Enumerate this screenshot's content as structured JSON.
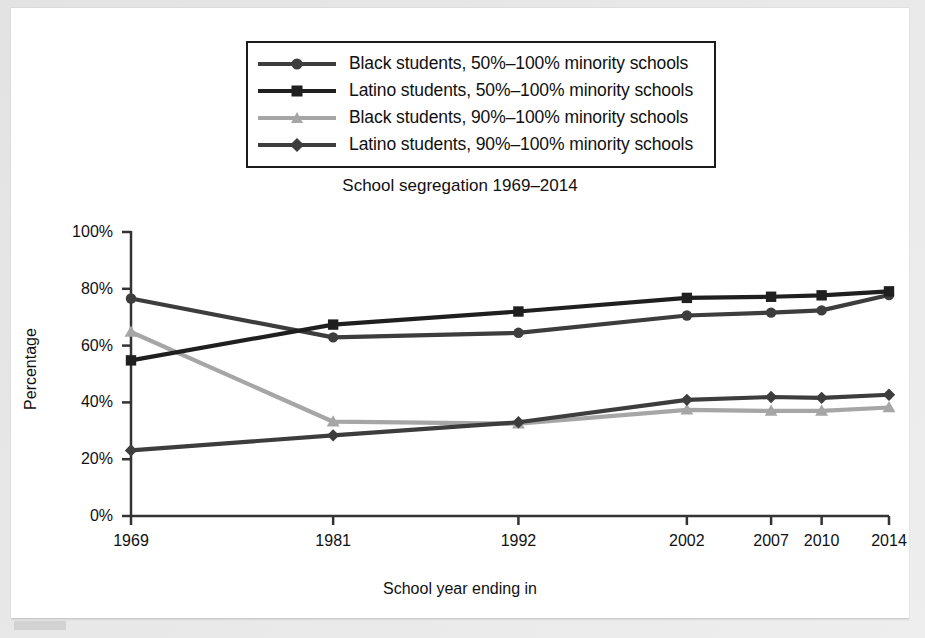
{
  "chart_data": {
    "type": "line",
    "title": "School segregation 1969–2014",
    "xlabel": "School year ending in",
    "ylabel": "Percentage",
    "x": [
      1969,
      1981,
      1992,
      2002,
      2007,
      2010,
      2014
    ],
    "categories": [
      "1969",
      "1981",
      "1992",
      "2002",
      "2007",
      "2010",
      "2014"
    ],
    "ylim": [
      0,
      100
    ],
    "yticks": [
      0,
      20,
      40,
      60,
      80,
      100
    ],
    "ytick_labels": [
      "0%",
      "20%",
      "40%",
      "60%",
      "80%",
      "100%"
    ],
    "grid": false,
    "legend_position": "top-center-outside",
    "series": [
      {
        "name": "Black students, 50%–100% minority schools",
        "marker": "circle",
        "color": "#3d3d3d",
        "values": [
          76.6,
          62.9,
          64.5,
          70.6,
          71.6,
          72.4,
          77.8
        ]
      },
      {
        "name": "Latino students, 50%–100% minority schools",
        "marker": "square",
        "color": "#1f1f1f",
        "values": [
          54.8,
          67.4,
          72.0,
          76.8,
          77.2,
          77.7,
          79.1
        ]
      },
      {
        "name": "Black students, 90%–100% minority schools",
        "marker": "triangle",
        "color": "#a6a6a6",
        "values": [
          64.8,
          33.2,
          32.5,
          37.4,
          37.0,
          37.0,
          38.2
        ]
      },
      {
        "name": "Latino students, 90%–100% minority schools",
        "marker": "diamond",
        "color": "#3d3d3d",
        "values": [
          23.1,
          28.4,
          33.0,
          40.9,
          41.9,
          41.6,
          42.7
        ]
      }
    ]
  },
  "legend": {
    "items": [
      {
        "label": "Black students, 50%–100% minority schools",
        "marker": "circle",
        "color": "#3d3d3d"
      },
      {
        "label": "Latino students, 50%–100% minority schools",
        "marker": "square",
        "color": "#1f1f1f"
      },
      {
        "label": "Black students, 90%–100% minority schools",
        "marker": "triangle",
        "color": "#a6a6a6"
      },
      {
        "label": "Latino students, 90%–100% minority schools",
        "marker": "diamond",
        "color": "#3d3d3d"
      }
    ]
  },
  "colors": {
    "page_background": "#e9e9e9",
    "paper": "#ffffff",
    "axis": "#333333",
    "text": "#111111",
    "legend_border": "#1c1c1c"
  }
}
